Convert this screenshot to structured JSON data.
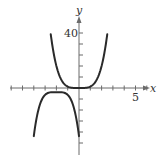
{
  "chart_data": {
    "type": "line",
    "title": "",
    "xlabel": "x",
    "ylabel": "y",
    "xlim": [
      -6.1,
      6.1
    ],
    "ylim": [
      -45,
      48
    ],
    "grid": false,
    "x_ticks_step": 1,
    "y_ticks_step": 8,
    "tick_labels": {
      "x": [
        {
          "value": 5,
          "label": "5"
        }
      ],
      "y": [
        {
          "value": 40,
          "label": "40"
        }
      ]
    },
    "series": [
      {
        "name": "upper curve",
        "formula": "y = x^4",
        "x": [
          -2.5,
          -2,
          -1.5,
          -1,
          -0.5,
          0,
          0.5,
          1,
          1.5,
          2,
          2.5
        ],
        "values": [
          39.1,
          16,
          5.1,
          1,
          0.06,
          0,
          0.06,
          1,
          5.1,
          16,
          39.1
        ]
      },
      {
        "name": "lower curve",
        "formula": "y = -2(x+2)^4 - 3",
        "x": [
          -4,
          -3.5,
          -3,
          -2.5,
          -2,
          -1.5,
          -1,
          -0.5,
          0
        ],
        "values": [
          -35,
          -13.1,
          -5,
          -3.1,
          -3,
          -3.1,
          -5,
          -13.1,
          -35
        ]
      }
    ]
  },
  "labels": {
    "x_axis": "x",
    "y_axis": "y",
    "y_tick_40": "40",
    "x_tick_5": "5"
  },
  "colors": {
    "curve": "#2a2a2a",
    "axis": "#6b6b6b"
  }
}
